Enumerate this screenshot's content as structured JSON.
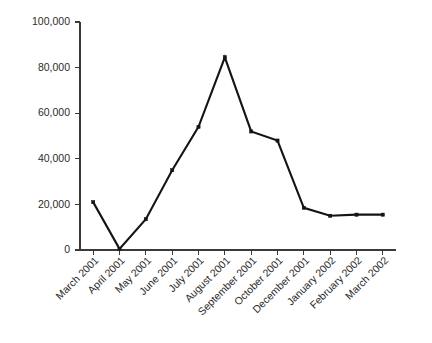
{
  "chart_data": {
    "type": "line",
    "title": "",
    "subtitle": "",
    "xlabel": "",
    "ylabel": "",
    "categories": [
      "March 2001",
      "April 2001",
      "May 2001",
      "June 2001",
      "July 2001",
      "August 2001",
      "September 2001",
      "October 2001",
      "December 2001",
      "January 2002",
      "February 2002",
      "March 2002"
    ],
    "values": [
      21000,
      500,
      13500,
      35000,
      54000,
      84500,
      52000,
      48000,
      18500,
      15000,
      15500,
      15500
    ],
    "ylim": [
      0,
      100000
    ],
    "ytick_values": [
      0,
      20000,
      40000,
      60000,
      80000,
      100000
    ],
    "ytick_labels": [
      "0",
      "20,000",
      "40,000",
      "60,000",
      "80,000",
      "100,000"
    ],
    "grid": false,
    "legend": false,
    "legend_position": "none",
    "marker": "square",
    "line_color": "#141414",
    "axis_color": "#3a3a3a",
    "background_color": "#ffffff",
    "xlabel_rotation": -45
  }
}
